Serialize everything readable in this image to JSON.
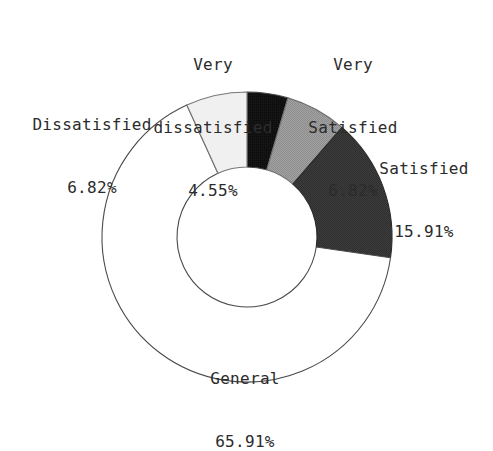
{
  "chart_data": {
    "type": "pie",
    "variant": "donut",
    "title": "",
    "subtitle": "",
    "xlabel": "",
    "ylabel": "",
    "units": "%",
    "legend_position": "none",
    "labels_position": "outside-callout",
    "grid": false,
    "start_angle_deg": 0,
    "direction": "clockwise",
    "inner_radius_ratio": 0.483,
    "total_percent": 100.0,
    "categories": [
      "Very dissatisfied",
      "Very Satisfied",
      "Satisfied",
      "General",
      "Dissatisfied"
    ],
    "values": [
      4.55,
      6.82,
      15.91,
      65.91,
      6.82
    ],
    "slices": [
      {
        "name": "Very dissatisfied",
        "label_line1": "Very",
        "label_line2": "dissatisfied",
        "value": 4.55,
        "value_text": "4.55%",
        "color": "#141414",
        "stroke": "#4a4a4a",
        "start_deg": 0.0,
        "end_deg": 16.38
      },
      {
        "name": "Very Satisfied",
        "label_line1": "Very",
        "label_line2": "Satisfied",
        "value": 6.82,
        "value_text": "6.82%",
        "color": "#9c9c9c",
        "stroke": "#6f6f6f",
        "start_deg": 16.38,
        "end_deg": 40.93
      },
      {
        "name": "Satisfied",
        "label_line1": "Satisfied",
        "label_line2": "",
        "value": 15.91,
        "value_text": "15.91%",
        "color": "#3a3a3a",
        "stroke": "#2a2a2a",
        "start_deg": 40.93,
        "end_deg": 98.21
      },
      {
        "name": "General",
        "label_line1": "General",
        "label_line2": "",
        "value": 65.91,
        "value_text": "65.91%",
        "color": "#ffffff",
        "stroke": "#4a4a4a",
        "start_deg": 98.21,
        "end_deg": 335.49
      },
      {
        "name": "Dissatisfied",
        "label_line1": "Dissatisfied",
        "label_line2": "",
        "value": 6.82,
        "value_text": "6.82%",
        "color": "#f0f0f0",
        "stroke": "#767676",
        "start_deg": 335.49,
        "end_deg": 360.0
      }
    ]
  },
  "labels": {
    "very_dissatisfied": {
      "line1": "Very",
      "line2": "dissatisfied",
      "value": "4.55%"
    },
    "very_satisfied": {
      "line1": "Very",
      "line2": "Satisfied",
      "value": "6.82%"
    },
    "satisfied": {
      "line1": "Satisfied",
      "value": "15.91%"
    },
    "general": {
      "line1": "General",
      "value": "65.91%"
    },
    "dissatisfied": {
      "line1": "Dissatisfied",
      "value": "6.82%"
    }
  },
  "colors": {
    "background": "#ffffff",
    "text": "#2b2b2b",
    "outline": "#4a4a4a",
    "very_dissatisfied": "#141414",
    "very_satisfied": "#9c9c9c",
    "satisfied": "#3a3a3a",
    "general": "#ffffff",
    "dissatisfied": "#f0f0f0"
  },
  "geometry": {
    "center_x": 247,
    "center_y": 237,
    "outer_radius": 145,
    "inner_radius": 70
  }
}
